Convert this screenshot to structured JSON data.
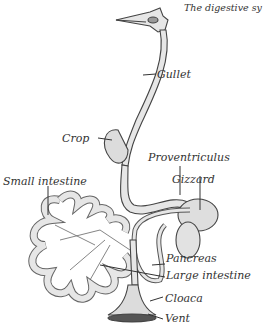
{
  "title": "The digestive sy",
  "labels": {
    "gullet": "Gullet",
    "crop": "Crop",
    "proventriculus": "Proventriculus",
    "gizzard": "Gizzard",
    "small_intestine": "Small intestine",
    "pancreas": "Pancreas",
    "large_intestine": "Large intestine",
    "cloaca": "Cloaca",
    "vent": "Vent"
  },
  "colors": {
    "ink": "#333333",
    "fill": "#e4e4e4",
    "background": "#ffffff"
  }
}
